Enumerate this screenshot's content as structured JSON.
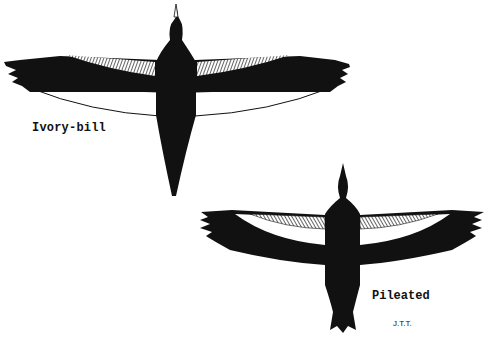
{
  "figure": {
    "ink_color": "#111111",
    "background": "#ffffff"
  },
  "birds": [
    {
      "name": "ivory-bill",
      "label": "Ivory-bill",
      "wing_pattern": "white trailing edge, hatched leading coverts"
    },
    {
      "name": "pileated",
      "label": "Pileated",
      "wing_pattern": "white inner band, hatched coverts, black trailing edge"
    }
  ],
  "credit": "J.T.T."
}
